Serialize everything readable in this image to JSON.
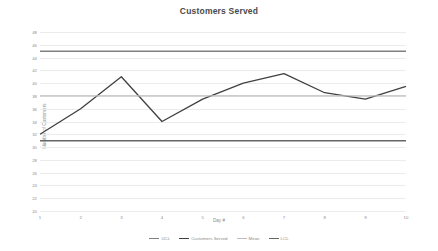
{
  "chart_data": {
    "type": "line",
    "title": "Customers Served",
    "xlabel": "Day #",
    "ylabel": "Number of Customers",
    "categories": [
      "1",
      "2",
      "3",
      "4",
      "5",
      "6",
      "7",
      "8",
      "9",
      "10"
    ],
    "x": [
      1,
      2,
      3,
      4,
      5,
      6,
      7,
      8,
      9,
      10
    ],
    "ylim": [
      20,
      48
    ],
    "xlim": [
      1,
      10
    ],
    "ytick_step": 2,
    "ytick_labels": [
      "20",
      "22",
      "24",
      "26",
      "28",
      "30",
      "32",
      "34",
      "36",
      "38",
      "40",
      "42",
      "44",
      "46",
      "48"
    ],
    "grid": true,
    "legend_position": "bottom",
    "series": [
      {
        "name": "UCL",
        "type": "constant",
        "value": 45,
        "color": "#808080",
        "width": 1.6
      },
      {
        "name": "Customers Served",
        "type": "line",
        "values": [
          32,
          36,
          41,
          34,
          37.5,
          40,
          41.5,
          38.5,
          37.5,
          39.5
        ],
        "color": "#404040",
        "width": 1.3
      },
      {
        "name": "Mean",
        "type": "constant",
        "value": 38,
        "color": "#bdbdbd",
        "width": 1.3
      },
      {
        "name": "LCL",
        "type": "constant",
        "value": 31,
        "color": "#666666",
        "width": 1.6
      }
    ]
  },
  "colors": {
    "background": "#ffffff",
    "grid": "#ececec",
    "text": "#8c8c8c",
    "title": "#4a4a4a"
  }
}
